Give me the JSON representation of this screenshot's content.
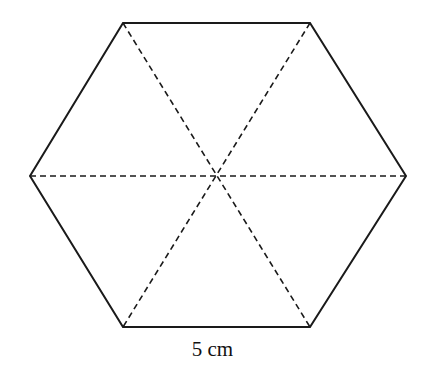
{
  "diagram": {
    "shape": "regular-hexagon",
    "vertices": [
      {
        "x": 123,
        "y": 23
      },
      {
        "x": 310,
        "y": 23
      },
      {
        "x": 406,
        "y": 176
      },
      {
        "x": 310,
        "y": 327
      },
      {
        "x": 123,
        "y": 327
      },
      {
        "x": 30,
        "y": 176
      }
    ],
    "center": {
      "x": 216,
      "y": 176
    },
    "diagonals": [
      {
        "from": 0,
        "to": 3
      },
      {
        "from": 1,
        "to": 4
      },
      {
        "from": 2,
        "to": 5
      }
    ],
    "side_label": "5 cm",
    "colors": {
      "stroke": "#1a1a1a",
      "background": "#ffffff"
    }
  }
}
